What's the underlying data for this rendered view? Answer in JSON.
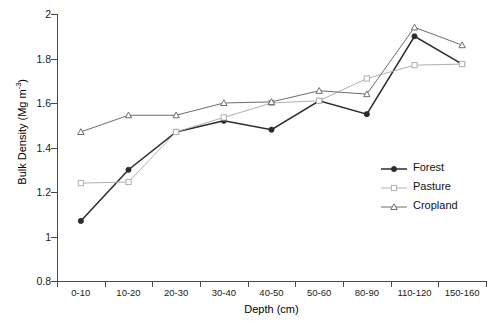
{
  "chart_data": {
    "type": "line",
    "title": "",
    "xlabel": "Depth (cm)",
    "ylabel": "Bulk Density (Mg m-3)",
    "ylabel_base": "Bulk Density (Mg m",
    "ylabel_sup": "-3",
    "ylabel_tail": ")",
    "categories": [
      "0-10",
      "10-20",
      "20-30",
      "30-40",
      "40-50",
      "50-60",
      "80-90",
      "110-120",
      "150-160"
    ],
    "ylim": [
      0.8,
      2.0
    ],
    "ytick_labels": [
      "2",
      "1.8",
      "1.6",
      "1.4",
      "1.2",
      "1",
      "0.8"
    ],
    "ytick_values": [
      2.0,
      1.8,
      1.6,
      1.4,
      1.2,
      1.0,
      0.8
    ],
    "grid": false,
    "legend_position": "inside-right",
    "series": [
      {
        "name": "Forest",
        "marker": "filled-circle",
        "color": "#2b2b2b",
        "values": [
          1.07,
          1.3,
          1.47,
          1.52,
          1.48,
          1.61,
          1.55,
          1.9,
          1.775
        ]
      },
      {
        "name": "Pasture",
        "marker": "open-square",
        "color": "#b0b0b0",
        "values": [
          1.24,
          1.245,
          1.47,
          1.535,
          1.6,
          1.61,
          1.71,
          1.77,
          1.775
        ]
      },
      {
        "name": "Cropland",
        "marker": "open-triangle",
        "color": "#6d6d6d",
        "values": [
          1.47,
          1.545,
          1.545,
          1.6,
          1.605,
          1.655,
          1.64,
          1.94,
          1.86
        ]
      }
    ]
  },
  "legend": {
    "items": [
      {
        "label": "Forest"
      },
      {
        "label": "Pasture"
      },
      {
        "label": "Cropland"
      }
    ]
  }
}
